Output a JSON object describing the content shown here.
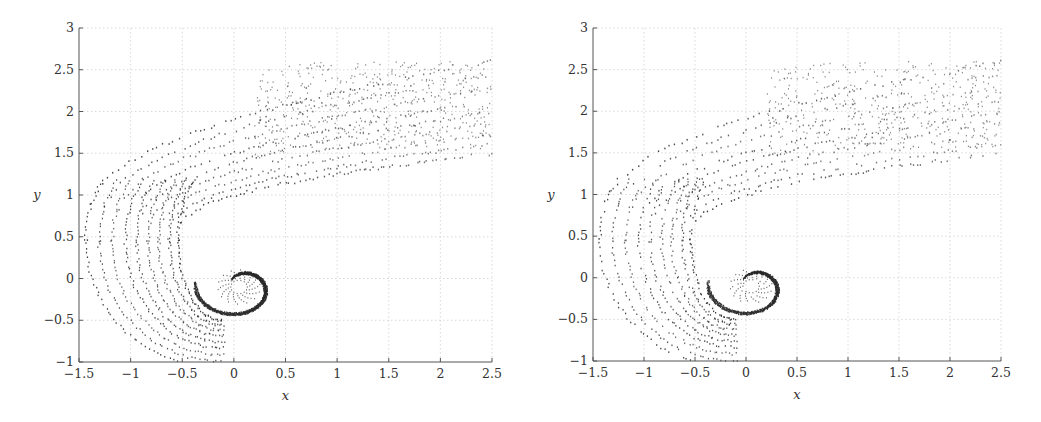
{
  "chart_data": [
    {
      "type": "scatter",
      "title": "",
      "xlabel": "x",
      "ylabel": "y",
      "xlim": [
        -1.5,
        2.5
      ],
      "ylim": [
        -1,
        3
      ],
      "xticks": [
        "-1.5",
        "-1",
        "-0.5",
        "0",
        "0.5",
        "1",
        "1.5",
        "2",
        "2.5"
      ],
      "yticks": [
        "-1",
        "-0.5",
        "0",
        "0.5",
        "1",
        "1.5",
        "2",
        "2.5",
        "3"
      ],
      "grid": true,
      "legend": null,
      "description": "Particle positions forming a roll-up spiral: tightly wound core centered near (0.05, -0.1) with radius ~0.4, outer arms sweeping from (-1.25, 0.5) up and over to a streaming band between y=1.5 and y=2.65 extending to x=2.5",
      "features": {
        "core_center": [
          0.05,
          -0.1
        ],
        "core_outer_radius": 0.42,
        "outer_band_leftmost_x": -1.28,
        "band_top_y": 2.65,
        "band_bottom_y": 1.5,
        "spiral_bottom_y": -0.7
      }
    },
    {
      "type": "scatter",
      "title": "",
      "xlabel": "x",
      "ylabel": "y",
      "xlim": [
        -1.5,
        2.5
      ],
      "ylim": [
        -1,
        3
      ],
      "xticks": [
        "-1.5",
        "-1",
        "-0.5",
        "0",
        "0.5",
        "1",
        "1.5",
        "2",
        "2.5"
      ],
      "yticks": [
        "-1",
        "-0.5",
        "0",
        "0.5",
        "1",
        "1.5",
        "2",
        "2.5",
        "3"
      ],
      "grid": true,
      "legend": null,
      "description": "Same configuration with sparser particle layers: roll-up core near (0.05, -0.1), outer arms reaching x=-1.25, streaming band between y=1.5 and y=2.65 to x=2.5",
      "features": {
        "core_center": [
          0.05,
          -0.1
        ],
        "core_outer_radius": 0.42,
        "outer_band_leftmost_x": -1.25,
        "band_top_y": 2.65,
        "band_bottom_y": 1.5,
        "spiral_bottom_y": -0.7
      }
    }
  ],
  "panels": [
    {
      "left": 0,
      "axes": {
        "x0": 79,
        "x1": 492,
        "y0": 28,
        "y1": 362
      },
      "xlabel": "x",
      "ylabel": "y",
      "density": 1.0,
      "seed": 7
    },
    {
      "left": 514,
      "axes": {
        "x0": 79,
        "x1": 487,
        "y0": 28,
        "y1": 361
      },
      "xlabel": "x",
      "ylabel": "y",
      "density": 0.8,
      "seed": 13
    }
  ],
  "colors": {
    "points": "#2a2a2a",
    "grid": "#c8c8c8",
    "axis": "#555555",
    "text": "#333333"
  }
}
